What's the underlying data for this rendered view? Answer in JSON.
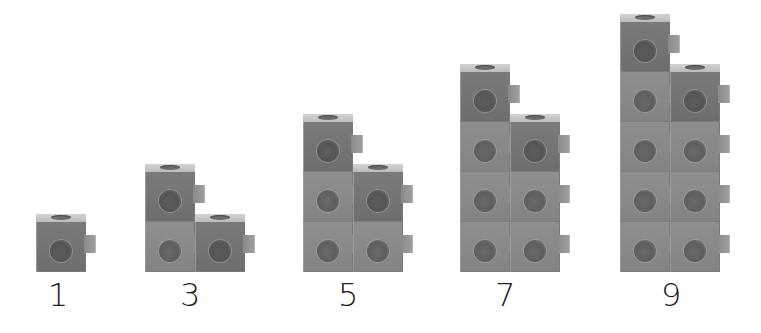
{
  "figure": {
    "colors": {
      "cube_body": "#888888",
      "cube_top_row": "#737373",
      "top_face": "#c8c8c8",
      "label_text": "#222222",
      "background": "#ffffff"
    },
    "groups": [
      {
        "label": "1",
        "x": 36,
        "label_x": 48,
        "columns": [
          1
        ]
      },
      {
        "label": "3",
        "x": 145,
        "label_x": 180,
        "columns": [
          2,
          1
        ]
      },
      {
        "label": "5",
        "x": 303,
        "label_x": 338,
        "columns": [
          3,
          2
        ]
      },
      {
        "label": "7",
        "x": 460,
        "label_x": 495,
        "columns": [
          4,
          3
        ]
      },
      {
        "label": "9",
        "x": 620,
        "label_x": 661,
        "columns": [
          5,
          4
        ]
      }
    ]
  }
}
